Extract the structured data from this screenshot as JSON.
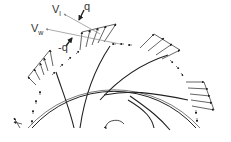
{
  "diagram": {
    "labels": {
      "v_l": {
        "main": "V",
        "sub": "l"
      },
      "q": "q",
      "v_w": {
        "main": "V",
        "sub": "w"
      },
      "neg_q": "-q"
    },
    "colors": {
      "stroke": "#222222",
      "background": "#ffffff",
      "label": "#333333"
    }
  }
}
